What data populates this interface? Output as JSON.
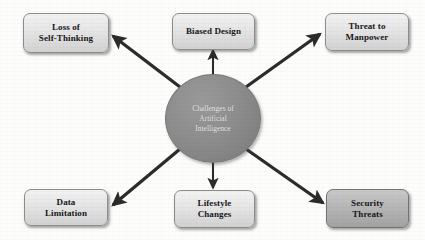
{
  "diagram": {
    "center": {
      "label": "Challenges of\nArtificial\nIntelligence",
      "shape": "ellipse",
      "fill_color": "#8a8a8a",
      "text_color": "#efeff0"
    },
    "nodes": [
      {
        "id": "loss-of-self-thinking",
        "label": "Loss of\nSelf-Thinking",
        "position": "top-left",
        "fill_color": "#e6e6e6",
        "text_color": "#17171a"
      },
      {
        "id": "biased-design",
        "label": "Biased Design",
        "position": "top-center",
        "fill_color": "#e6e6e6",
        "text_color": "#17171a"
      },
      {
        "id": "threat-to-manpower",
        "label": "Threat to\nManpower",
        "position": "top-right",
        "fill_color": "#e6e6e6",
        "text_color": "#17171a"
      },
      {
        "id": "data-limitation",
        "label": "Data\nLimitation",
        "position": "bottom-left",
        "fill_color": "#e6e6e6",
        "text_color": "#17171a"
      },
      {
        "id": "lifestyle-changes",
        "label": "Lifestyle\nChanges",
        "position": "bottom-center",
        "fill_color": "#e6e6e6",
        "text_color": "#17171a"
      },
      {
        "id": "security-threats",
        "label": "Security\nThreats",
        "position": "bottom-right",
        "fill_color": "#b6b6b6",
        "text_color": "#17171a"
      }
    ],
    "connectors": [
      {
        "id": "arrow-to-loss-of-self-thinking",
        "from": "center",
        "to": "loss-of-self-thinking",
        "style": "solid-arrow",
        "color": "#2b2b2b"
      },
      {
        "id": "arrow-to-biased-design",
        "from": "center",
        "to": "biased-design",
        "style": "solid-arrow",
        "color": "#2b2b2b"
      },
      {
        "id": "arrow-to-threat-to-manpower",
        "from": "center",
        "to": "threat-to-manpower",
        "style": "solid-arrow",
        "color": "#2b2b2b"
      },
      {
        "id": "arrow-to-data-limitation",
        "from": "center",
        "to": "data-limitation",
        "style": "solid-arrow",
        "color": "#2b2b2b"
      },
      {
        "id": "arrow-to-lifestyle-changes",
        "from": "center",
        "to": "lifestyle-changes",
        "style": "solid-arrow",
        "color": "#2b2b2b"
      },
      {
        "id": "arrow-to-security-threats",
        "from": "center",
        "to": "security-threats",
        "style": "solid-arrow",
        "color": "#2b2b2b"
      }
    ]
  }
}
